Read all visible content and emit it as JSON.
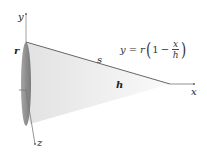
{
  "diagram": {
    "type": "cone",
    "axes": {
      "x_label": "x",
      "y_label": "y",
      "z_label": "z"
    },
    "labels": {
      "radius": "r",
      "slant": "s",
      "height": "h"
    },
    "equation": {
      "lhs": "y",
      "equals": "=",
      "r": "r",
      "open_paren": "(",
      "one": "1",
      "minus": "−",
      "numerator": "x",
      "denominator": "h",
      "close_paren": ")"
    },
    "colors": {
      "axis": "#777777",
      "cone_fill_light": "#f2f2f2",
      "cone_fill_dark": "#d9d9d9",
      "base_ellipse": "#8a8a8a",
      "slant_line": "#555555"
    }
  }
}
